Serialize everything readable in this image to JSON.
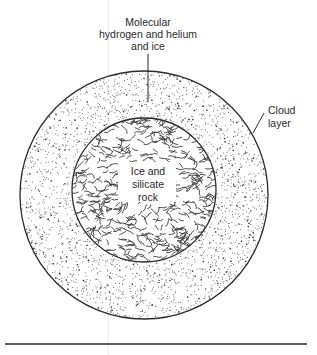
{
  "diagram": {
    "layers": [
      {
        "id": "core",
        "label_lines": [
          "Ice and",
          "silicate",
          "rock"
        ],
        "texture": "vermiculate"
      },
      {
        "id": "envelope",
        "label_lines": [
          "Molecular",
          "hydrogen and helium",
          "and ice"
        ],
        "texture": "stipple"
      },
      {
        "id": "cloud",
        "label_lines": [
          "Cloud",
          "layer"
        ],
        "texture": "boundary"
      }
    ],
    "colors": {
      "ink": "#2a2a2a",
      "paper": "#ffffff",
      "stipple": "#555555"
    }
  }
}
